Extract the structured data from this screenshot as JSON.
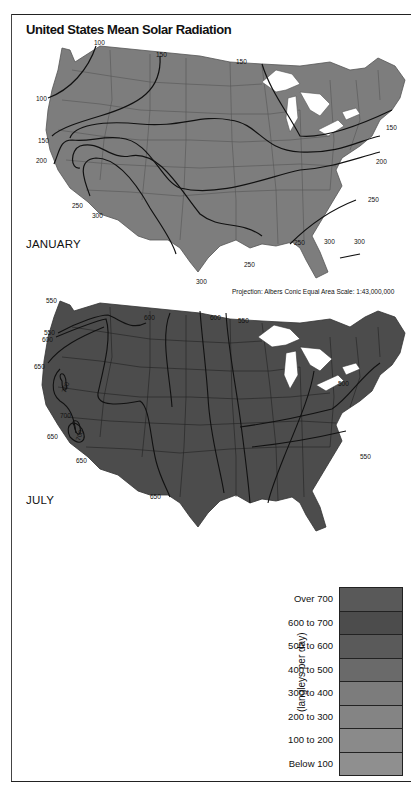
{
  "title": "United States Mean Solar Radiation",
  "maps": [
    {
      "month": "JANUARY",
      "fill_color": "#7d7d7d",
      "contour_labels": [
        "100",
        "150",
        "150",
        "100",
        "150",
        "150",
        "200",
        "200",
        "250",
        "250",
        "300",
        "250",
        "250",
        "300",
        "300",
        "250",
        "300"
      ]
    },
    {
      "month": "JULY",
      "fill_color": "#4c4c4c",
      "contour_labels": [
        "550",
        "600",
        "600",
        "550",
        "550",
        "600",
        "650",
        "700",
        "700",
        "700",
        "650",
        "650",
        "650",
        "500",
        "550"
      ]
    }
  ],
  "projection_note": "Projection: Albers Conic Equal Area    Scale: 1:43,000,000",
  "legend": {
    "unit_label": "(langleys per day)",
    "items": [
      {
        "label": "Over 700",
        "color": "#595959"
      },
      {
        "label": "600 to 700",
        "color": "#4c4c4c"
      },
      {
        "label": "500 to 600",
        "color": "#5a5a5a"
      },
      {
        "label": "400 to 500",
        "color": "#6a6a6a"
      },
      {
        "label": "300 to 400",
        "color": "#7c7c7c"
      },
      {
        "label": "200 to 300",
        "color": "#848484"
      },
      {
        "label": "100 to 200",
        "color": "#8a8a8a"
      },
      {
        "label": "Below 100",
        "color": "#8f8f8f"
      }
    ]
  }
}
